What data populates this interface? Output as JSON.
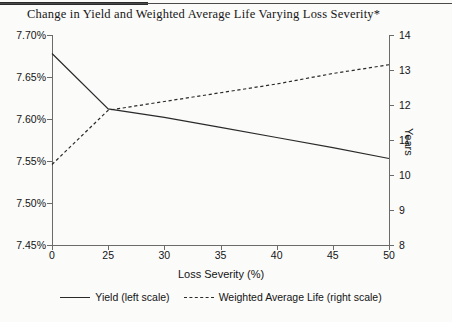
{
  "title": "Change in Yield and Weighted Average Life Varying Loss Severity*",
  "footnote": "",
  "axes": {
    "x": {
      "label": "Loss Severity (%)",
      "ticks": [
        "0",
        "25",
        "30",
        "35",
        "40",
        "45",
        "50"
      ]
    },
    "y_left": {
      "label": "",
      "ticks": [
        "7.70%",
        "7.65%",
        "7.60%",
        "7.55%",
        "7.50%",
        "7.45%"
      ]
    },
    "y_right": {
      "label": "Years",
      "ticks": [
        "14",
        "13",
        "12",
        "11",
        "10",
        "9",
        "8"
      ]
    }
  },
  "legend": {
    "items": [
      {
        "label": "Yield (left scale)",
        "style": "solid"
      },
      {
        "label": "Weighted Average Life (right scale)",
        "style": "dashed"
      }
    ]
  },
  "chart_data": {
    "type": "line",
    "title": "Change in Yield and Weighted Average Life Varying Loss Severity*",
    "xlabel": "Loss Severity (%)",
    "ylabel": "",
    "y2label": "Years",
    "x": [
      0,
      25,
      30,
      35,
      40,
      45,
      50
    ],
    "x_tick_labels": [
      "0",
      "25",
      "30",
      "35",
      "40",
      "45",
      "50"
    ],
    "x_scale_note": "ticks evenly spaced in pixels; scale break between 0 and 25",
    "ylim": [
      7.45,
      7.7
    ],
    "y2lim": [
      8,
      14
    ],
    "grid": false,
    "legend_position": "below-axes",
    "series": [
      {
        "name": "Yield (left scale)",
        "axis": "left",
        "unit": "%",
        "style": "solid",
        "values": [
          7.678,
          7.612,
          7.602,
          7.59,
          7.578,
          7.566,
          7.553
        ]
      },
      {
        "name": "Weighted Average Life (right scale)",
        "axis": "right",
        "unit": "years",
        "style": "dashed",
        "values": [
          10.3,
          11.85,
          12.1,
          12.35,
          12.6,
          12.9,
          13.15
        ]
      }
    ]
  }
}
